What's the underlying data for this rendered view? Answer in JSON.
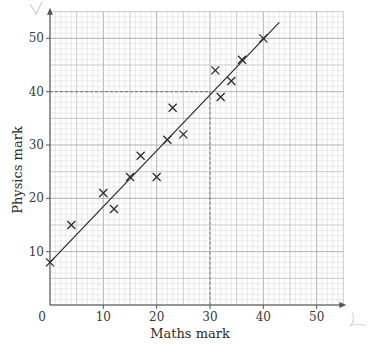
{
  "chart_data": {
    "type": "scatter",
    "title": "",
    "xlabel": "Maths mark",
    "ylabel": "Physics mark",
    "xlim": [
      0,
      55
    ],
    "ylim": [
      0,
      55
    ],
    "x_ticks": [
      0,
      10,
      20,
      30,
      40,
      50
    ],
    "y_ticks": [
      10,
      20,
      30,
      40,
      50
    ],
    "x_tick_labels": [
      "0",
      "10",
      "20",
      "30",
      "40",
      "50"
    ],
    "y_tick_labels": [
      "10",
      "20",
      "30",
      "40",
      "50"
    ],
    "grid": true,
    "marker": "x",
    "points": [
      {
        "x": 0,
        "y": 8
      },
      {
        "x": 4,
        "y": 15
      },
      {
        "x": 10,
        "y": 21
      },
      {
        "x": 12,
        "y": 18
      },
      {
        "x": 15,
        "y": 24
      },
      {
        "x": 17,
        "y": 28
      },
      {
        "x": 20,
        "y": 24
      },
      {
        "x": 22,
        "y": 31
      },
      {
        "x": 23,
        "y": 37
      },
      {
        "x": 25,
        "y": 32
      },
      {
        "x": 31,
        "y": 44
      },
      {
        "x": 32,
        "y": 39
      },
      {
        "x": 34,
        "y": 42
      },
      {
        "x": 36,
        "y": 46
      },
      {
        "x": 40,
        "y": 50
      }
    ],
    "line_of_best_fit": {
      "x1": 0,
      "y1": 8,
      "x2": 43,
      "y2": 53
    },
    "annotations": [
      {
        "type": "dashed-guide",
        "from": {
          "x": 0,
          "y": 40
        },
        "to": {
          "x": 30,
          "y": 40
        }
      },
      {
        "type": "dashed-guide",
        "from": {
          "x": 30,
          "y": 40
        },
        "to": {
          "x": 30,
          "y": 0
        }
      }
    ]
  },
  "colors": {
    "minor_grid": "#dcdcdc",
    "mid_grid": "#c4c4c4",
    "major_grid": "#a8a8a8",
    "axis": "#555555",
    "marker": "#2a2a2a",
    "line": "#2a2a2a",
    "dashed": "#777777"
  }
}
